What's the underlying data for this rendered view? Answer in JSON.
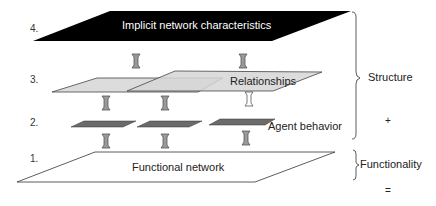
{
  "layers": [
    {
      "number": "1.",
      "label": "Functional network"
    },
    {
      "number": "2.",
      "label": "Agent behavior"
    },
    {
      "number": "3.",
      "label": "Relationships"
    },
    {
      "number": "4.",
      "label": "Implicit network characteristics"
    }
  ],
  "groups": {
    "structure": "Structure",
    "functionality": "Functionality"
  },
  "operators": {
    "plus": "+",
    "equals": "="
  },
  "colors": {
    "layer4_fill": "#000000",
    "layer3_fill": "#d9d9d9",
    "layer2_fill": "#6b6b6b",
    "layer1_fill": "#ffffff",
    "arrow_fill": "#9a9a9a",
    "arrow_outline_fill": "#ffffff",
    "stroke": "#333333"
  }
}
